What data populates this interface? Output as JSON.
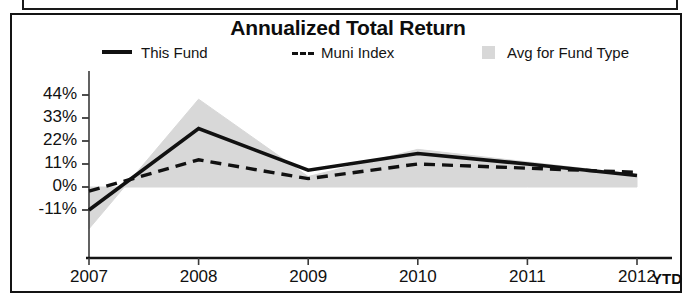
{
  "chart_data": {
    "type": "line",
    "title": "Annualized Total Return",
    "xlabel": "",
    "ylabel": "",
    "categories": [
      "2007",
      "2008",
      "2009",
      "2010",
      "2011",
      "2012"
    ],
    "x_axis_suffix_label": "YTD",
    "ytick_labels": [
      "44%",
      "33%",
      "22%",
      "11%",
      "0%",
      "-11%"
    ],
    "ytick_values": [
      44,
      33,
      22,
      11,
      0,
      -11
    ],
    "ylim": [
      -22,
      48
    ],
    "grid": false,
    "legend_position": "top",
    "series": [
      {
        "name": "This Fund",
        "style": "solid",
        "color": "#111111",
        "values": [
          -11,
          28,
          8,
          16,
          11,
          5.5
        ]
      },
      {
        "name": "Muni Index",
        "style": "dashed",
        "color": "#111111",
        "values": [
          -2,
          13,
          4,
          11,
          9,
          7
        ]
      },
      {
        "name": "Avg for Fund Type",
        "style": "band",
        "color": "#d8d8d8",
        "values": [
          -20,
          42,
          5,
          18,
          12,
          6
        ],
        "band_baseline": 0
      }
    ]
  },
  "legend": {
    "items": [
      {
        "label": "This Fund",
        "swatch": "solid-line-swatch"
      },
      {
        "label": "Muni Index",
        "swatch": "dashed-line-swatch"
      },
      {
        "label": "Avg for Fund Type",
        "swatch": "shaded-band-swatch"
      }
    ]
  },
  "colors": {
    "line": "#111111",
    "band": "#d8d8d8",
    "frame": "#141414",
    "background": "#ffffff"
  }
}
